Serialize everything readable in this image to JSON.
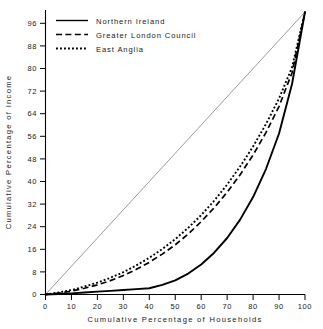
{
  "chart_data": {
    "type": "line",
    "title": "",
    "xlabel": "Cumulative Percentage of Households",
    "ylabel": "Cumulative Percentage of Income",
    "xlim": [
      0,
      100
    ],
    "ylim": [
      0,
      100
    ],
    "xticks": [
      0,
      10,
      20,
      30,
      40,
      50,
      60,
      70,
      80,
      90,
      100
    ],
    "yticks": [
      0,
      8,
      16,
      24,
      32,
      40,
      48,
      56,
      64,
      72,
      80,
      88,
      96
    ],
    "grid": false,
    "legend_position": "top-left",
    "reference_line": {
      "name": "line of equality",
      "x": [
        0,
        100
      ],
      "y": [
        0,
        100
      ],
      "style": "thin-solid",
      "color": "#808080",
      "in_legend": false
    },
    "x": [
      0,
      5,
      10,
      15,
      20,
      25,
      30,
      35,
      40,
      45,
      50,
      55,
      60,
      65,
      70,
      75,
      80,
      85,
      90,
      95,
      100
    ],
    "series": [
      {
        "name": "Northern Ireland",
        "style": "solid",
        "color": "#000000",
        "values": [
          0,
          0.2,
          0.4,
          0.7,
          1.0,
          1.3,
          1.6,
          1.9,
          2.2,
          3.4,
          5.0,
          7.4,
          10.6,
          14.8,
          20.0,
          26.5,
          34.5,
          44.5,
          57.0,
          74.5,
          100
        ]
      },
      {
        "name": "Greater London Council",
        "style": "dashed",
        "color": "#000000",
        "values": [
          0,
          0.5,
          1.2,
          2.2,
          3.4,
          4.9,
          6.7,
          8.9,
          11.4,
          14.3,
          17.6,
          21.4,
          25.8,
          30.7,
          36.2,
          42.4,
          49.4,
          57.4,
          66.6,
          78.5,
          100
        ]
      },
      {
        "name": "East Anglia",
        "style": "dotted",
        "color": "#000000",
        "values": [
          0,
          0.7,
          1.6,
          2.8,
          4.2,
          5.9,
          7.9,
          10.3,
          13.0,
          16.1,
          19.6,
          23.6,
          28.1,
          33.2,
          38.9,
          45.3,
          52.4,
          60.4,
          69.4,
          80.4,
          100
        ]
      }
    ]
  },
  "legend": {
    "items": [
      {
        "label": "Northern Ireland",
        "style": "solid"
      },
      {
        "label": "Greater London Council",
        "style": "dashed"
      },
      {
        "label": "East Anglia",
        "style": "dotted"
      }
    ]
  }
}
